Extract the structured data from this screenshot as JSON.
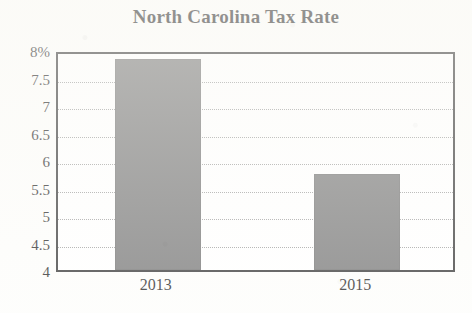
{
  "chart_data": {
    "type": "bar",
    "title": "North Carolina Tax Rate",
    "xlabel": "",
    "ylabel": "",
    "categories": [
      "2013",
      "2015"
    ],
    "values": [
      7.83,
      5.75
    ],
    "value_unit": "%",
    "ylim": [
      4,
      8
    ],
    "yticks": [
      4,
      4.5,
      5,
      5.5,
      6,
      6.5,
      7,
      7.5,
      8
    ],
    "ytick_labels": [
      "4",
      "4.5",
      "5",
      "5.5",
      "6",
      "6.5",
      "7",
      "7.5",
      "8%"
    ],
    "grid": true,
    "grid_style": "dotted-horizontal",
    "legend": null,
    "bar_color": "#737373",
    "plot_border_color": "#2e2e2e",
    "background_color": "#fdfdfb",
    "text_color": "#1b1b1b"
  }
}
